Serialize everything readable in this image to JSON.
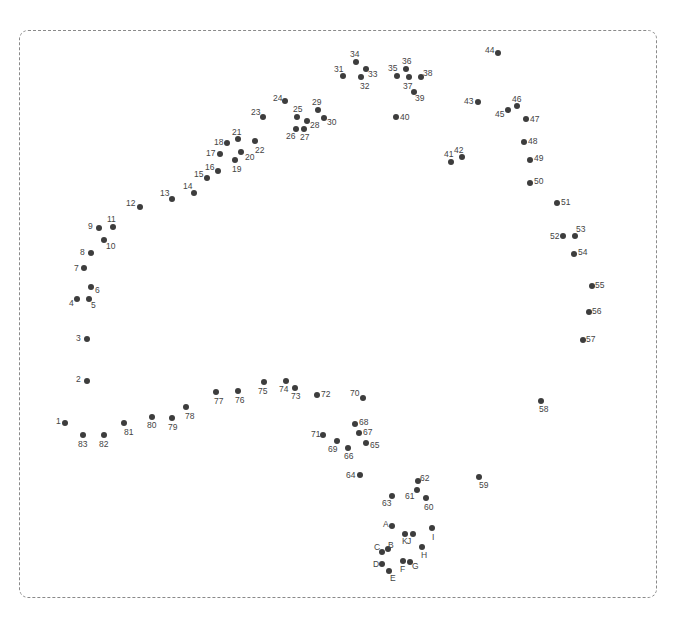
{
  "puzzle": {
    "type": "connect-the-dots",
    "frame": {
      "style": "dashed",
      "color": "#8a8a8a"
    },
    "dot_color": "#3d3d3d",
    "label_color": "#444444",
    "dots": [
      {
        "label": "1",
        "x": 65,
        "y": 423,
        "lx": -9,
        "ly": -6
      },
      {
        "label": "2",
        "x": 87,
        "y": 381,
        "lx": -11,
        "ly": -6
      },
      {
        "label": "3",
        "x": 87,
        "y": 339,
        "lx": -11,
        "ly": -5
      },
      {
        "label": "4",
        "x": 77,
        "y": 299,
        "lx": -8,
        "ly": 0
      },
      {
        "label": "5",
        "x": 89,
        "y": 299,
        "lx": 2,
        "ly": 2
      },
      {
        "label": "6",
        "x": 91,
        "y": 287,
        "lx": 4,
        "ly": -1
      },
      {
        "label": "7",
        "x": 84,
        "y": 268,
        "lx": -10,
        "ly": -4
      },
      {
        "label": "8",
        "x": 91,
        "y": 253,
        "lx": -11,
        "ly": -5
      },
      {
        "label": "9",
        "x": 99,
        "y": 228,
        "lx": -11,
        "ly": -6
      },
      {
        "label": "10",
        "x": 104,
        "y": 240,
        "lx": 2,
        "ly": 2
      },
      {
        "label": "11",
        "x": 113,
        "y": 227,
        "lx": -6,
        "ly": -12
      },
      {
        "label": "12",
        "x": 140,
        "y": 207,
        "lx": -14,
        "ly": -8
      },
      {
        "label": "13",
        "x": 172,
        "y": 199,
        "lx": -12,
        "ly": -10
      },
      {
        "label": "14",
        "x": 194,
        "y": 193,
        "lx": -11,
        "ly": -11
      },
      {
        "label": "15",
        "x": 207,
        "y": 178,
        "lx": -13,
        "ly": -8
      },
      {
        "label": "16",
        "x": 218,
        "y": 171,
        "lx": -13,
        "ly": -8
      },
      {
        "label": "17",
        "x": 220,
        "y": 154,
        "lx": -14,
        "ly": -5
      },
      {
        "label": "18",
        "x": 227,
        "y": 143,
        "lx": -13,
        "ly": -5
      },
      {
        "label": "19",
        "x": 235,
        "y": 160,
        "lx": -3,
        "ly": 5
      },
      {
        "label": "20",
        "x": 241,
        "y": 152,
        "lx": 4,
        "ly": 1
      },
      {
        "label": "21",
        "x": 238,
        "y": 139,
        "lx": -6,
        "ly": -11
      },
      {
        "label": "22",
        "x": 255,
        "y": 141,
        "lx": 0,
        "ly": 5
      },
      {
        "label": "23",
        "x": 263,
        "y": 117,
        "lx": -12,
        "ly": -9
      },
      {
        "label": "24",
        "x": 285,
        "y": 101,
        "lx": -12,
        "ly": -7
      },
      {
        "label": "25",
        "x": 297,
        "y": 117,
        "lx": -4,
        "ly": -12
      },
      {
        "label": "26",
        "x": 296,
        "y": 129,
        "lx": -10,
        "ly": 3
      },
      {
        "label": "27",
        "x": 304,
        "y": 129,
        "lx": -4,
        "ly": 4
      },
      {
        "label": "28",
        "x": 307,
        "y": 121,
        "lx": 3,
        "ly": 0
      },
      {
        "label": "29",
        "x": 318,
        "y": 110,
        "lx": -6,
        "ly": -12
      },
      {
        "label": "30",
        "x": 324,
        "y": 118,
        "lx": 3,
        "ly": 0
      },
      {
        "label": "31",
        "x": 343,
        "y": 76,
        "lx": -9,
        "ly": -11
      },
      {
        "label": "32",
        "x": 361,
        "y": 77,
        "lx": -1,
        "ly": 5
      },
      {
        "label": "33",
        "x": 366,
        "y": 69,
        "lx": 2,
        "ly": 1
      },
      {
        "label": "34",
        "x": 356,
        "y": 62,
        "lx": -6,
        "ly": -12
      },
      {
        "label": "35",
        "x": 397,
        "y": 76,
        "lx": -9,
        "ly": -12
      },
      {
        "label": "36",
        "x": 406,
        "y": 69,
        "lx": -4,
        "ly": -12
      },
      {
        "label": "37",
        "x": 409,
        "y": 77,
        "lx": -6,
        "ly": 5
      },
      {
        "label": "38",
        "x": 421,
        "y": 77,
        "lx": 2,
        "ly": -8
      },
      {
        "label": "39",
        "x": 414,
        "y": 92,
        "lx": 1,
        "ly": 2
      },
      {
        "label": "40",
        "x": 396,
        "y": 117,
        "lx": 4,
        "ly": -4
      },
      {
        "label": "41",
        "x": 451,
        "y": 162,
        "lx": -7,
        "ly": -12
      },
      {
        "label": "42",
        "x": 462,
        "y": 157,
        "lx": -8,
        "ly": -11
      },
      {
        "label": "43",
        "x": 478,
        "y": 102,
        "lx": -14,
        "ly": -5
      },
      {
        "label": "44",
        "x": 498,
        "y": 53,
        "lx": -13,
        "ly": -7
      },
      {
        "label": "45",
        "x": 508,
        "y": 110,
        "lx": -13,
        "ly": 0
      },
      {
        "label": "46",
        "x": 517,
        "y": 106,
        "lx": -5,
        "ly": -11
      },
      {
        "label": "47",
        "x": 526,
        "y": 119,
        "lx": 4,
        "ly": -4
      },
      {
        "label": "48",
        "x": 524,
        "y": 142,
        "lx": 4,
        "ly": -5
      },
      {
        "label": "49",
        "x": 530,
        "y": 160,
        "lx": 4,
        "ly": -6
      },
      {
        "label": "50",
        "x": 530,
        "y": 183,
        "lx": 4,
        "ly": -6
      },
      {
        "label": "51",
        "x": 557,
        "y": 203,
        "lx": 4,
        "ly": -5
      },
      {
        "label": "52",
        "x": 563,
        "y": 236,
        "lx": -13,
        "ly": -4
      },
      {
        "label": "53",
        "x": 575,
        "y": 236,
        "lx": 1,
        "ly": -11
      },
      {
        "label": "54",
        "x": 574,
        "y": 254,
        "lx": 4,
        "ly": -6
      },
      {
        "label": "55",
        "x": 592,
        "y": 286,
        "lx": 3,
        "ly": -5
      },
      {
        "label": "56",
        "x": 589,
        "y": 312,
        "lx": 3,
        "ly": -5
      },
      {
        "label": "57",
        "x": 583,
        "y": 340,
        "lx": 3,
        "ly": -5
      },
      {
        "label": "58",
        "x": 541,
        "y": 401,
        "lx": -2,
        "ly": 4
      },
      {
        "label": "59",
        "x": 479,
        "y": 477,
        "lx": 0,
        "ly": 4
      },
      {
        "label": "60",
        "x": 426,
        "y": 498,
        "lx": -2,
        "ly": 5
      },
      {
        "label": "61",
        "x": 417,
        "y": 490,
        "lx": -12,
        "ly": 2
      },
      {
        "label": "62",
        "x": 418,
        "y": 481,
        "lx": 2,
        "ly": -7
      },
      {
        "label": "63",
        "x": 392,
        "y": 496,
        "lx": -10,
        "ly": 3
      },
      {
        "label": "64",
        "x": 360,
        "y": 475,
        "lx": -14,
        "ly": -4
      },
      {
        "label": "65",
        "x": 366,
        "y": 443,
        "lx": 4,
        "ly": -2
      },
      {
        "label": "66",
        "x": 348,
        "y": 448,
        "lx": -4,
        "ly": 4
      },
      {
        "label": "67",
        "x": 359,
        "y": 433,
        "lx": 4,
        "ly": -5
      },
      {
        "label": "68",
        "x": 355,
        "y": 424,
        "lx": 4,
        "ly": -6
      },
      {
        "label": "69",
        "x": 337,
        "y": 441,
        "lx": -9,
        "ly": 4
      },
      {
        "label": "70",
        "x": 363,
        "y": 398,
        "lx": -13,
        "ly": -9
      },
      {
        "label": "71",
        "x": 323,
        "y": 435,
        "lx": -12,
        "ly": -5
      },
      {
        "label": "72",
        "x": 317,
        "y": 395,
        "lx": 4,
        "ly": -5
      },
      {
        "label": "73",
        "x": 295,
        "y": 388,
        "lx": -4,
        "ly": 4
      },
      {
        "label": "74",
        "x": 286,
        "y": 381,
        "lx": -7,
        "ly": 4
      },
      {
        "label": "75",
        "x": 264,
        "y": 382,
        "lx": -6,
        "ly": 5
      },
      {
        "label": "76",
        "x": 238,
        "y": 391,
        "lx": -3,
        "ly": 5
      },
      {
        "label": "77",
        "x": 216,
        "y": 392,
        "lx": -2,
        "ly": 5
      },
      {
        "label": "78",
        "x": 186,
        "y": 407,
        "lx": -1,
        "ly": 5
      },
      {
        "label": "79",
        "x": 172,
        "y": 418,
        "lx": -4,
        "ly": 5
      },
      {
        "label": "80",
        "x": 152,
        "y": 417,
        "lx": -5,
        "ly": 4
      },
      {
        "label": "81",
        "x": 124,
        "y": 423,
        "lx": 0,
        "ly": 5
      },
      {
        "label": "82",
        "x": 104,
        "y": 435,
        "lx": -5,
        "ly": 5
      },
      {
        "label": "83",
        "x": 83,
        "y": 435,
        "lx": -5,
        "ly": 5
      },
      {
        "label": "A",
        "x": 392,
        "y": 526,
        "lx": -9,
        "ly": -6
      },
      {
        "label": "B",
        "x": 388,
        "y": 549,
        "lx": 0,
        "ly": -8
      },
      {
        "label": "C",
        "x": 382,
        "y": 552,
        "lx": -8,
        "ly": -9
      },
      {
        "label": "D",
        "x": 382,
        "y": 564,
        "lx": -9,
        "ly": -4
      },
      {
        "label": "E",
        "x": 389,
        "y": 571,
        "lx": 1,
        "ly": 3
      },
      {
        "label": "F",
        "x": 403,
        "y": 561,
        "lx": -3,
        "ly": 4
      },
      {
        "label": "G",
        "x": 410,
        "y": 562,
        "lx": 2,
        "ly": 0
      },
      {
        "label": "H",
        "x": 422,
        "y": 547,
        "lx": -1,
        "ly": 4
      },
      {
        "label": "I",
        "x": 432,
        "y": 528,
        "lx": 0,
        "ly": 5
      },
      {
        "label": "J",
        "x": 413,
        "y": 534,
        "lx": -6,
        "ly": 3
      },
      {
        "label": "K",
        "x": 405,
        "y": 534,
        "lx": -3,
        "ly": 3
      }
    ]
  }
}
